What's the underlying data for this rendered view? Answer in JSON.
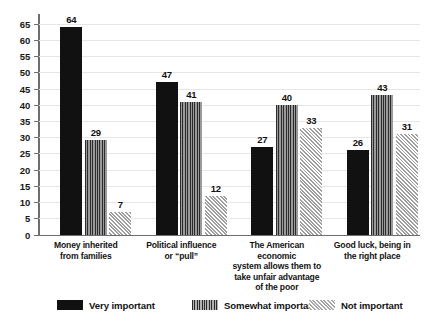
{
  "chart_data": {
    "type": "bar",
    "title": "",
    "subtitle": "",
    "xlabel": "",
    "ylabel": "",
    "ylim": [
      0,
      68
    ],
    "grid": true,
    "legend_position": "bottom",
    "yticks": [
      0,
      5,
      10,
      15,
      20,
      25,
      30,
      35,
      40,
      45,
      50,
      55,
      60,
      65
    ],
    "ytick_labels": [
      "0",
      "5",
      "10",
      "15",
      "20",
      "25",
      "30",
      "35",
      "40",
      "45",
      "50",
      "55",
      "60",
      "65"
    ],
    "categories": [
      "Money inherited\nfrom families",
      "Political influence\nor “pull”",
      "The American economic\nsystem allows them to\ntake unfair advantage\nof the poor",
      "Good luck, being in\nthe right place"
    ],
    "category_lines": [
      [
        "Money inherited",
        "from families"
      ],
      [
        "Political influence",
        "or “pull”"
      ],
      [
        "The American economic",
        "system allows them to",
        "take unfair advantage",
        "of the poor"
      ],
      [
        "Good luck, being in",
        "the right place"
      ]
    ],
    "series": [
      {
        "name": "Very important",
        "fill": "solid",
        "color": "#111111",
        "values": [
          64,
          47,
          27,
          26
        ],
        "labels": [
          "64",
          "47",
          "27",
          "26"
        ]
      },
      {
        "name": "Somewhat important",
        "fill": "vertical-stripes",
        "color": "#8a8a8a",
        "values": [
          29,
          41,
          40,
          43
        ],
        "labels": [
          "29",
          "41",
          "40",
          "43"
        ]
      },
      {
        "name": "Not important",
        "fill": "diagonal-hatch",
        "color": "#d2d2d2",
        "values": [
          7,
          12,
          33,
          31
        ],
        "labels": [
          "7",
          "12",
          "33",
          "31"
        ]
      }
    ]
  },
  "legend": {
    "items": [
      {
        "label": "Very important"
      },
      {
        "label": "Somewhat important"
      },
      {
        "label": "Not important"
      }
    ]
  },
  "colors": {
    "very_important": "#111111",
    "somewhat_important": "#8a8a8a",
    "not_important": "#d2d2d2",
    "axis": "#6e6e6e",
    "gridline": "#e6e6e6",
    "text": "#141414",
    "background": "#ffffff"
  }
}
